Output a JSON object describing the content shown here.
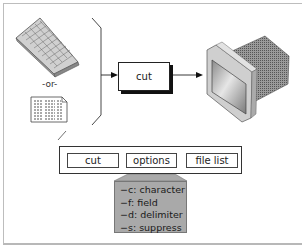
{
  "diagram": {
    "input_alternative_label": "-or-",
    "process_label": "cut",
    "inputs": [
      {
        "name": "keyboard",
        "icon": "keyboard-icon"
      },
      {
        "name": "file",
        "icon": "document-icon"
      }
    ],
    "output": {
      "name": "monitor",
      "icon": "monitor-icon"
    }
  },
  "syntax": {
    "parts": [
      {
        "label": "cut"
      },
      {
        "label": "options"
      },
      {
        "label": "file list"
      }
    ],
    "options": [
      {
        "label": "−c: character"
      },
      {
        "label": "−f: field"
      },
      {
        "label": "−d: delimiter"
      },
      {
        "label": "−s: suppress"
      }
    ]
  },
  "colors": {
    "frame": "#bdbdbd",
    "options_panel": "#a9a9a9",
    "stroke": "#222222"
  }
}
